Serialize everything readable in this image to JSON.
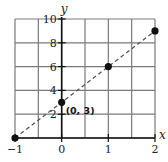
{
  "chart_data": {
    "type": "scatter",
    "title": "",
    "xlabel": "x",
    "ylabel": "y",
    "xlim": [
      -1,
      2
    ],
    "ylim": [
      0,
      10
    ],
    "grid": true,
    "x_grid_step": 0.5,
    "y_grid_step": 2,
    "x_ticks": [
      -1,
      0,
      1,
      2
    ],
    "x_tick_labels": [
      "−1",
      "0",
      "1",
      "2"
    ],
    "y_ticks": [
      2,
      4,
      6,
      8,
      10
    ],
    "y_tick_labels": [
      "2",
      "4",
      "6",
      "8",
      "10"
    ],
    "series": [
      {
        "name": "points",
        "x": [
          -1,
          0,
          1,
          2
        ],
        "y": [
          0,
          3,
          6,
          9
        ]
      }
    ],
    "trend_line": {
      "style": "dashed",
      "from": [
        -1,
        0
      ],
      "to": [
        2,
        9
      ],
      "equation": "y = 3x + 3"
    },
    "annotations": [
      {
        "text": "(0, 3)",
        "x": 0,
        "y": 3
      }
    ],
    "colors": {
      "grid": "#7a7a7a",
      "axis": "#111111",
      "points": "#111111",
      "line": "#555555"
    }
  }
}
